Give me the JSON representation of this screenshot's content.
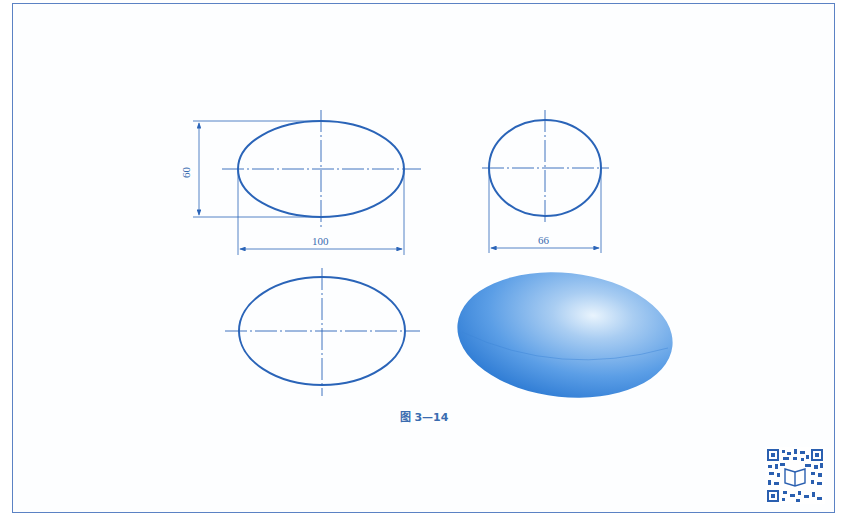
{
  "figure": {
    "caption": "图 3—14",
    "colors": {
      "line": "#2a64b8",
      "frame": "#5b82c4",
      "text": "#3a6cb0",
      "solid_fill_light": "#a9cdf2",
      "solid_fill_dark": "#2f7fd6"
    },
    "views": [
      {
        "name": "front-view",
        "type": "ellipse",
        "dimensions": {
          "width": "100",
          "height": "60"
        }
      },
      {
        "name": "side-view",
        "type": "ellipse",
        "dimensions": {
          "width": "66"
        }
      },
      {
        "name": "top-view",
        "type": "ellipse"
      },
      {
        "name": "3d-view",
        "type": "shaded-ellipsoid"
      }
    ],
    "labels": {
      "front_width": "100",
      "front_height": "60",
      "side_width": "66"
    },
    "qr_code": "qr-code"
  }
}
